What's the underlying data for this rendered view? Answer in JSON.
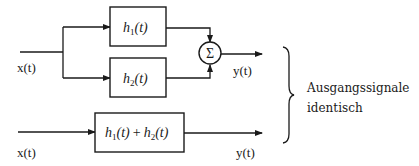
{
  "diagram": {
    "top_system": {
      "input_label": "x(t)",
      "block1": {
        "name": "h",
        "sub": "1",
        "arg": "(t)"
      },
      "block2": {
        "name": "h",
        "sub": "2",
        "arg": "(t)"
      },
      "summer_symbol": "Σ",
      "output_label": "y(t)"
    },
    "bottom_system": {
      "input_label": "x(t)",
      "block": {
        "term1": {
          "name": "h",
          "sub": "1",
          "arg": "(t)"
        },
        "operator": "+",
        "term2": {
          "name": "h",
          "sub": "2",
          "arg": "(t)"
        }
      },
      "output_label": "y(t)"
    },
    "annotation": {
      "line1": "Ausgangssignale",
      "line2": "identisch"
    },
    "colors": {
      "stroke": "#1a1a1a",
      "background": "#ffffff"
    }
  }
}
